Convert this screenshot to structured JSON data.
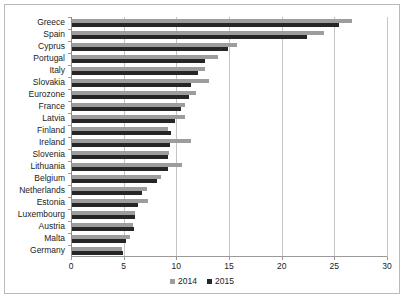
{
  "chart_data": {
    "type": "bar",
    "orientation": "horizontal",
    "title": "",
    "subtitle": "",
    "xlabel": "",
    "ylabel": "",
    "xlim": [
      0,
      30
    ],
    "xticks": [
      0,
      5,
      10,
      15,
      20,
      25,
      30
    ],
    "xtick_labels": [
      "0",
      "5",
      "10",
      "15",
      "20",
      "25",
      "30"
    ],
    "grid": true,
    "grid_axis": "x",
    "legend_position": "bottom",
    "categories": [
      "Greece",
      "Spain",
      "Cyprus",
      "Portugal",
      "Italy",
      "Slovakia",
      "Eurozone",
      "France",
      "Latvia",
      "Finland",
      "Ireland",
      "Slovenia",
      "Lithuania",
      "Belgium",
      "Netherlands",
      "Estonia",
      "Luxembourg",
      "Austria",
      "Malta",
      "Germany"
    ],
    "series": [
      {
        "name": "2014",
        "color": "#9d9d9d",
        "values": [
          26.7,
          24.0,
          15.8,
          14.0,
          12.7,
          13.1,
          11.9,
          10.8,
          10.8,
          9.2,
          11.4,
          9.3,
          10.5,
          8.5,
          7.2,
          7.3,
          6.1,
          5.9,
          5.6,
          4.8
        ]
      },
      {
        "name": "2015",
        "color": "#262626",
        "values": [
          25.4,
          22.4,
          14.9,
          12.7,
          12.1,
          11.4,
          11.2,
          10.4,
          9.9,
          9.5,
          9.4,
          9.2,
          9.2,
          8.2,
          6.7,
          6.4,
          6.1,
          6.0,
          5.2,
          4.9
        ]
      }
    ]
  },
  "legend": {
    "items": [
      {
        "label": "2014",
        "color": "#9d9d9d"
      },
      {
        "label": "2015",
        "color": "#262626"
      }
    ]
  }
}
